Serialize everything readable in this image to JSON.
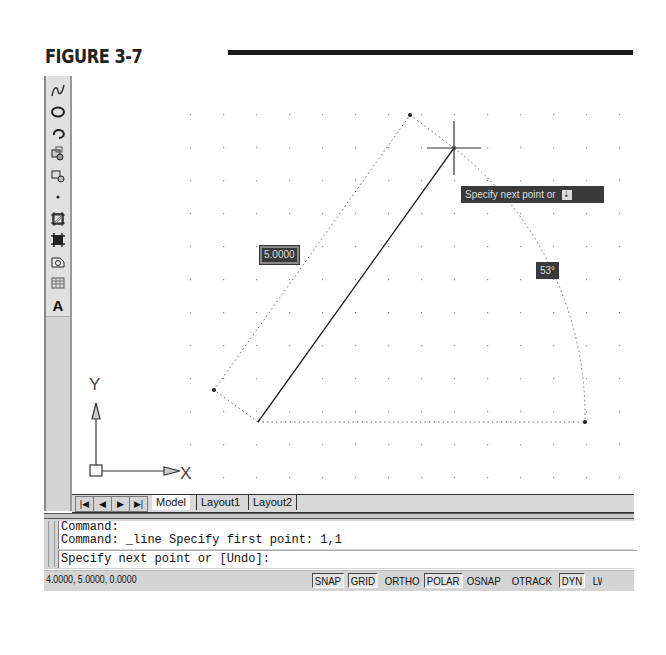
{
  "figure": {
    "title": "FIGURE 3-7"
  },
  "toolbar": {
    "tools": [
      {
        "name": "spline-icon"
      },
      {
        "name": "ellipse-icon"
      },
      {
        "name": "ellipse-arc-icon"
      },
      {
        "name": "insert-block-icon"
      },
      {
        "name": "make-block-icon"
      },
      {
        "name": "point-icon"
      },
      {
        "name": "hatch-icon"
      },
      {
        "name": "gradient-icon"
      },
      {
        "name": "region-icon"
      },
      {
        "name": "table-icon"
      },
      {
        "name": "multiline-text-icon",
        "label": "A"
      }
    ]
  },
  "canvas": {
    "grid": {
      "spacing": 33,
      "color": "#888888"
    },
    "length_input": "5.0000",
    "angle_input": "53°",
    "tooltip": "Specify next point or",
    "ucs": {
      "x_label": "X",
      "y_label": "Y"
    }
  },
  "tabs": {
    "nav": [
      "first",
      "prev",
      "next",
      "last"
    ],
    "items": [
      {
        "label": "Model",
        "active": true
      },
      {
        "label": "Layout1",
        "active": false
      },
      {
        "label": "Layout2",
        "active": false
      }
    ]
  },
  "command": {
    "history": [
      "Command:",
      "Command: _line Specify first point: 1,1"
    ],
    "prompt": "Specify next point or [Undo]:"
  },
  "status": {
    "coordinates": "4.0000, 5.0000, 0.0000",
    "buttons": [
      {
        "label": "SNAP",
        "on": true
      },
      {
        "label": "GRID",
        "on": true
      },
      {
        "label": "ORTHO",
        "on": false
      },
      {
        "label": "POLAR",
        "on": true
      },
      {
        "label": "OSNAP",
        "on": false
      },
      {
        "label": "OTRACK",
        "on": false
      },
      {
        "label": "DYN",
        "on": true
      },
      {
        "label": "LW",
        "on": false
      }
    ]
  }
}
